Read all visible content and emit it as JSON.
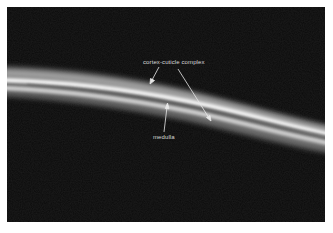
{
  "figure": {
    "background_color": "#0a0a0a",
    "fiber_color": "#e6e6e6",
    "annotations": [
      {
        "id": "cortex-cuticle",
        "text": "cortex-cuticle complex",
        "arrow_count": 2
      },
      {
        "id": "medulla",
        "text": "medulla",
        "arrow_count": 1
      }
    ]
  }
}
